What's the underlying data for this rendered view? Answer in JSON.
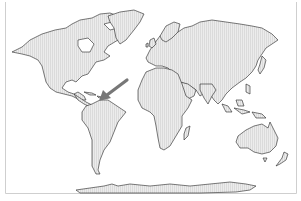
{
  "map": {
    "type": "world-outline",
    "projection": "equirectangular-like",
    "land_style": "light-gray-hatched",
    "colors": {
      "background": "#ffffff",
      "land_fill": "#ececec",
      "hatch_line": "#d0d0d0",
      "coastline": "#222222",
      "frame": "#cfcfcf",
      "arrow": "#777777"
    },
    "regions": [
      {
        "name": "North America"
      },
      {
        "name": "Greenland"
      },
      {
        "name": "South America"
      },
      {
        "name": "Europe-Asia"
      },
      {
        "name": "Africa"
      },
      {
        "name": "Arabian Peninsula"
      },
      {
        "name": "Madagascar"
      },
      {
        "name": "Australia"
      },
      {
        "name": "New Zealand"
      },
      {
        "name": "Southeast Asia Islands"
      },
      {
        "name": "Japan"
      },
      {
        "name": "British Isles"
      },
      {
        "name": "Antarctica"
      }
    ],
    "annotation": {
      "type": "arrow",
      "points_to": "Caribbean / northern South America (Venezuela coast)"
    }
  }
}
